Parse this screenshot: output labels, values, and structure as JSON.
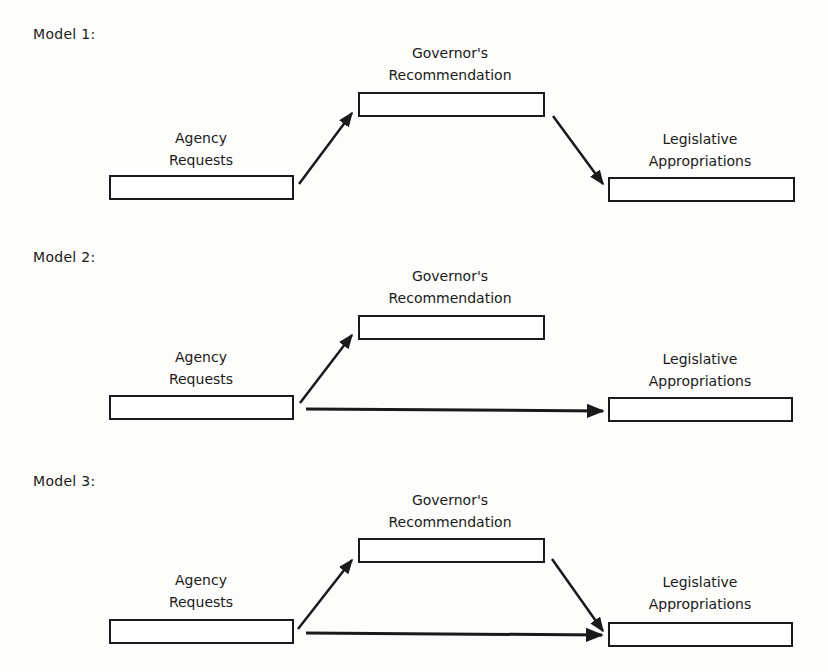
{
  "models": [
    {
      "title": "Model 1:",
      "nodes": {
        "agency": {
          "line1": "Agency",
          "line2": "Requests"
        },
        "governor": {
          "line1": "Governor's",
          "line2": "Recommendation"
        },
        "legislative": {
          "line1": "Legislative",
          "line2": "Appropriations"
        }
      },
      "edges": [
        "agency->governor",
        "governor->legislative"
      ]
    },
    {
      "title": "Model 2:",
      "nodes": {
        "agency": {
          "line1": "Agency",
          "line2": "Requests"
        },
        "governor": {
          "line1": "Governor's",
          "line2": "Recommendation"
        },
        "legislative": {
          "line1": "Legislative",
          "line2": "Appropriations"
        }
      },
      "edges": [
        "agency->governor",
        "agency->legislative"
      ]
    },
    {
      "title": "Model 3:",
      "nodes": {
        "agency": {
          "line1": "Agency",
          "line2": "Requests"
        },
        "governor": {
          "line1": "Governor's",
          "line2": "Recommendation"
        },
        "legislative": {
          "line1": "Legislative",
          "line2": "Appropriations"
        }
      },
      "edges": [
        "agency->governor",
        "governor->legislative",
        "agency->legislative"
      ]
    }
  ]
}
